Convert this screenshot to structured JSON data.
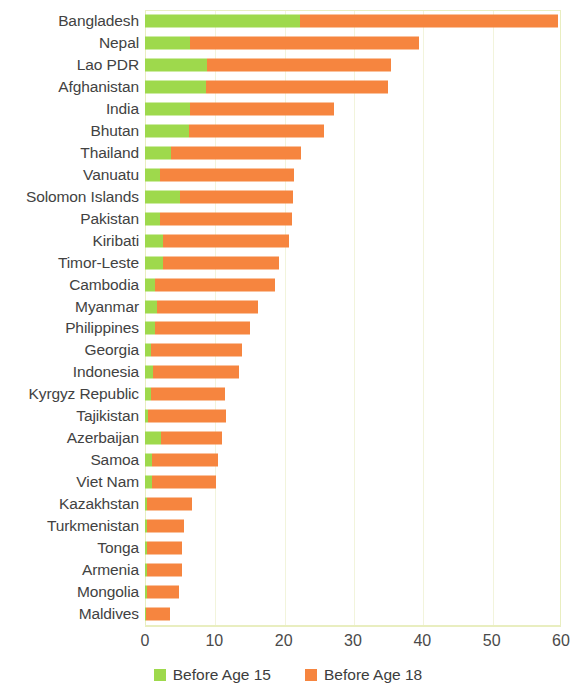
{
  "chart_data": {
    "type": "bar",
    "orientation": "horizontal",
    "stacked": true,
    "title": "",
    "subtitle": "",
    "xlabel": "",
    "ylabel": "",
    "xlim": [
      0,
      60
    ],
    "xticks": [
      0,
      10,
      20,
      30,
      40,
      50,
      60
    ],
    "xtick_labels": [
      "0",
      "10",
      "20",
      "30",
      "40",
      "50",
      "60"
    ],
    "grid": true,
    "grid_axis": "x",
    "legend_position": "bottom",
    "colors": {
      "before_age_15": "#9ed94c",
      "before_age_18": "#f6853f",
      "grid": "#f2f4dc",
      "frame": "#e9eec0",
      "text": "#424242"
    },
    "categories": [
      "Bangladesh",
      "Nepal",
      "Lao PDR",
      "Afghanistan",
      "India",
      "Bhutan",
      "Thailand",
      "Vanuatu",
      "Solomon Islands",
      "Pakistan",
      "Kiribati",
      "Timor-Leste",
      "Cambodia",
      "Myanmar",
      "Philippines",
      "Georgia",
      "Indonesia",
      "Kyrgyz Republic",
      "Tajikistan",
      "Azerbaijan",
      "Samoa",
      "Viet Nam",
      "Kazakhstan",
      "Turkmenistan",
      "Tonga",
      "Armenia",
      "Mongolia",
      "Maldives"
    ],
    "series": [
      {
        "name": "Before Age 15",
        "color": "#9ed94c",
        "values": [
          22.3,
          6.5,
          9.0,
          8.8,
          6.5,
          6.3,
          3.8,
          2.1,
          5.0,
          2.2,
          2.6,
          2.6,
          1.5,
          1.8,
          1.5,
          0.9,
          1.2,
          0.9,
          0.4,
          2.3,
          1.0,
          1.0,
          0.3,
          0.3,
          0.3,
          0.3,
          0.3,
          0.2
        ]
      },
      {
        "name": "Before Age 18",
        "color": "#f6853f",
        "values": [
          59.5,
          39.5,
          35.5,
          35.0,
          27.3,
          25.8,
          22.5,
          21.5,
          21.3,
          21.2,
          20.8,
          19.3,
          18.8,
          16.3,
          15.2,
          14.0,
          13.6,
          11.6,
          11.7,
          11.1,
          10.5,
          10.2,
          6.8,
          5.6,
          5.4,
          5.3,
          4.9,
          3.6
        ]
      }
    ],
    "legend": [
      {
        "label": "Before Age 15",
        "color": "#9ed94c"
      },
      {
        "label": "Before Age 18",
        "color": "#f6853f"
      }
    ]
  }
}
